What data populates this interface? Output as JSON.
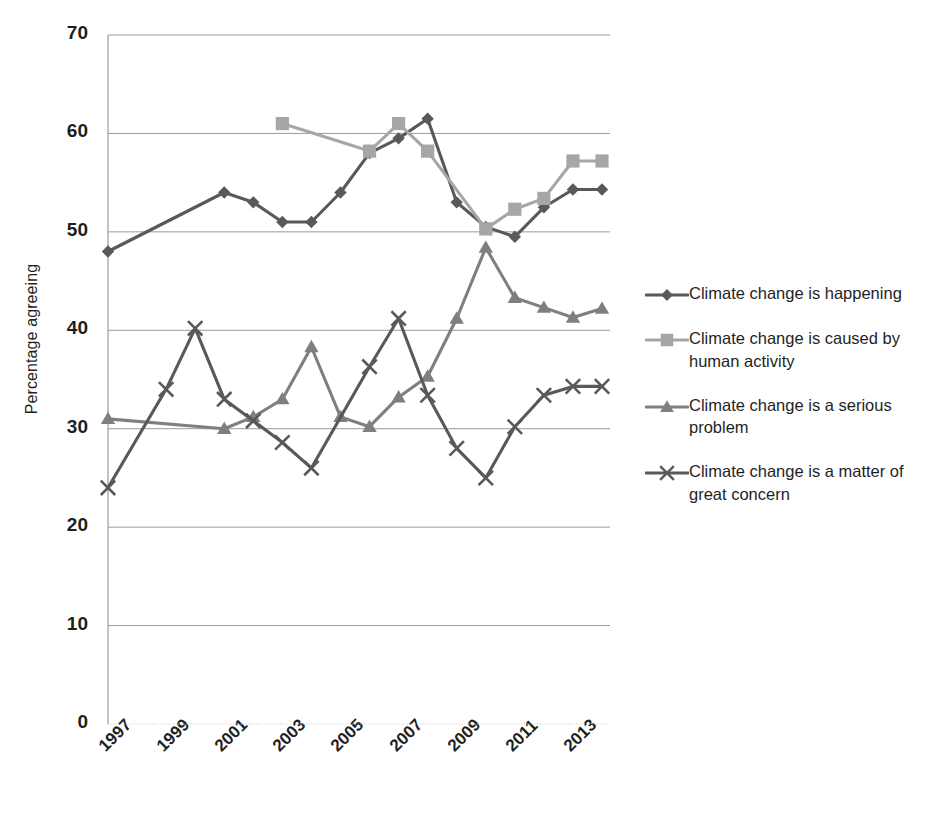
{
  "chart_data": {
    "type": "line",
    "title": "",
    "subtitle": "",
    "xlabel": "",
    "ylabel": "Percentage agreeing",
    "ylim": [
      0,
      70
    ],
    "ytick_step": 10,
    "yticks": [
      "70",
      "60",
      "50",
      "40",
      "30",
      "20",
      "10",
      "0"
    ],
    "xlim": [
      1997,
      2014
    ],
    "xticks": [
      "1997",
      "1999",
      "2001",
      "2003",
      "2005",
      "2007",
      "2009",
      "2011",
      "2013"
    ],
    "grid": "horizontal",
    "legend_position": "right",
    "series": [
      {
        "name": "Climate change is happening",
        "color": "#595959",
        "marker": "diamond",
        "points": [
          {
            "x": 1997,
            "y": 48,
            "connected": false
          },
          {
            "x": 2001,
            "y": 54,
            "connected": true
          },
          {
            "x": 2002,
            "y": 53,
            "connected": true
          },
          {
            "x": 2003,
            "y": 51,
            "connected": true
          },
          {
            "x": 2004,
            "y": 51,
            "connected": true
          },
          {
            "x": 2005,
            "y": 54,
            "connected": true
          },
          {
            "x": 2006,
            "y": 58,
            "connected": true
          },
          {
            "x": 2007,
            "y": 59.5,
            "connected": true
          },
          {
            "x": 2008,
            "y": 61.5,
            "connected": true
          },
          {
            "x": 2009,
            "y": 53,
            "connected": true
          },
          {
            "x": 2010,
            "y": 50.5,
            "connected": true
          },
          {
            "x": 2011,
            "y": 49.5,
            "connected": true
          },
          {
            "x": 2012,
            "y": 52.5,
            "connected": true
          },
          {
            "x": 2013,
            "y": 54.3,
            "connected": true
          },
          {
            "x": 2014,
            "y": 54.3,
            "connected": true
          }
        ]
      },
      {
        "name": "Climate change is caused by human activity",
        "color": "#a6a6a6",
        "marker": "square",
        "points": [
          {
            "x": 2003,
            "y": 61,
            "connected": false
          },
          {
            "x": 2006,
            "y": 58.2,
            "connected": true
          },
          {
            "x": 2007,
            "y": 61,
            "connected": true
          },
          {
            "x": 2008,
            "y": 58.2,
            "connected": true
          },
          {
            "x": 2010,
            "y": 50.3,
            "connected": true
          },
          {
            "x": 2011,
            "y": 52.3,
            "connected": true
          },
          {
            "x": 2012,
            "y": 53.4,
            "connected": true
          },
          {
            "x": 2013,
            "y": 57.2,
            "connected": true
          },
          {
            "x": 2014,
            "y": 57.2,
            "connected": true
          }
        ]
      },
      {
        "name": "Climate change is a serious problem",
        "color": "#7f7f7f",
        "marker": "triangle",
        "points": [
          {
            "x": 1997,
            "y": 31,
            "connected": false
          },
          {
            "x": 2001,
            "y": 30,
            "connected": true
          },
          {
            "x": 2002,
            "y": 31.2,
            "connected": true
          },
          {
            "x": 2003,
            "y": 33,
            "connected": true
          },
          {
            "x": 2004,
            "y": 38.3,
            "connected": true
          },
          {
            "x": 2005,
            "y": 31.2,
            "connected": true
          },
          {
            "x": 2006,
            "y": 30.2,
            "connected": true
          },
          {
            "x": 2007,
            "y": 33.2,
            "connected": true
          },
          {
            "x": 2008,
            "y": 35.3,
            "connected": true
          },
          {
            "x": 2009,
            "y": 41.2,
            "connected": true
          },
          {
            "x": 2010,
            "y": 48.4,
            "connected": true
          },
          {
            "x": 2011,
            "y": 43.3,
            "connected": true
          },
          {
            "x": 2012,
            "y": 42.3,
            "connected": true
          },
          {
            "x": 2013,
            "y": 41.3,
            "connected": true
          },
          {
            "x": 2014,
            "y": 42.2,
            "connected": true
          }
        ]
      },
      {
        "name": "Climate change is a matter of great concern",
        "color": "#595959",
        "marker": "cross",
        "points": [
          {
            "x": 1997,
            "y": 24,
            "connected": false
          },
          {
            "x": 1999,
            "y": 34,
            "connected": true
          },
          {
            "x": 2000,
            "y": 40.2,
            "connected": true
          },
          {
            "x": 2001,
            "y": 33,
            "connected": true
          },
          {
            "x": 2002,
            "y": 30.8,
            "connected": true
          },
          {
            "x": 2003,
            "y": 28.6,
            "connected": true
          },
          {
            "x": 2004,
            "y": 26,
            "connected": true
          },
          {
            "x": 2006,
            "y": 36.3,
            "connected": true
          },
          {
            "x": 2007,
            "y": 41.2,
            "connected": true
          },
          {
            "x": 2008,
            "y": 33.4,
            "connected": true
          },
          {
            "x": 2009,
            "y": 28,
            "connected": true
          },
          {
            "x": 2010,
            "y": 25,
            "connected": true
          },
          {
            "x": 2011,
            "y": 30.2,
            "connected": true
          },
          {
            "x": 2012,
            "y": 33.4,
            "connected": true
          },
          {
            "x": 2013,
            "y": 34.3,
            "connected": true
          },
          {
            "x": 2014,
            "y": 34.3,
            "connected": true
          }
        ]
      }
    ]
  },
  "legend": {
    "items": [
      {
        "label": "Climate change is happening",
        "marker": "diamond",
        "color": "#595959"
      },
      {
        "label": "Climate change is caused by human activity",
        "marker": "square",
        "color": "#a6a6a6"
      },
      {
        "label": "Climate change is a serious problem",
        "marker": "triangle",
        "color": "#7f7f7f"
      },
      {
        "label": "Climate change is a matter of great concern",
        "marker": "cross",
        "color": "#595959"
      }
    ]
  }
}
